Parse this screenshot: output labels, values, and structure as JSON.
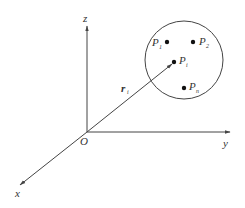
{
  "diagram": {
    "type": "3d-coordinate-system",
    "colors": {
      "line": "#444444",
      "text": "#333333",
      "background": "#ffffff"
    },
    "origin": {
      "label": "O"
    },
    "axes": [
      {
        "name": "x",
        "label": "x"
      },
      {
        "name": "y",
        "label": "y"
      },
      {
        "name": "z",
        "label": "z"
      }
    ],
    "vector": {
      "label": "r",
      "subscript": "i"
    },
    "region": {
      "shape": "circle"
    },
    "points": [
      {
        "label": "P",
        "subscript": "1"
      },
      {
        "label": "P",
        "subscript": "2"
      },
      {
        "label": "P",
        "subscript": "i"
      },
      {
        "label": "P",
        "subscript": "n"
      }
    ]
  }
}
